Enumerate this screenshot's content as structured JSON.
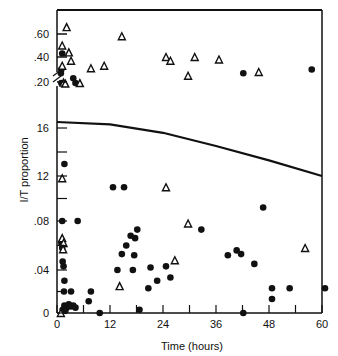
{
  "chart_data": {
    "type": "scatter",
    "title": "",
    "xlabel": "Time (hours)",
    "ylabel": "I/T proportion",
    "xlim": [
      0,
      60
    ],
    "x_ticks": [
      0,
      12,
      24,
      36,
      48,
      60
    ],
    "x_tick_labels": [
      "0",
      "12",
      "24",
      "36",
      "48",
      "60"
    ],
    "axis_break": "y-axis broken between .16 and .20 (upper panel .20–.60)",
    "y_lower": {
      "range": [
        0,
        0.17
      ],
      "ticks": [
        0,
        0.04,
        0.08,
        0.12,
        0.16
      ],
      "tick_labels": [
        "0",
        ".04",
        ".08",
        "12",
        "16"
      ]
    },
    "y_upper": {
      "range": [
        0.17,
        0.7
      ],
      "ticks": [
        0.2,
        0.4,
        0.6
      ],
      "tick_labels": [
        ".20",
        ".40",
        ".60"
      ]
    },
    "grid": false,
    "legend": "none",
    "series": [
      {
        "name": "filled circles",
        "marker": "circle-filled",
        "points": [
          [
            0.5,
            0.43
          ],
          [
            0.3,
            0.3
          ],
          [
            0.2,
            0.27
          ],
          [
            3,
            0.23
          ],
          [
            3.5,
            0.183
          ],
          [
            0.3,
            0.183
          ],
          [
            1,
            0.13
          ],
          [
            12,
            0.11
          ],
          [
            14.5,
            0.11
          ],
          [
            0.5,
            0.08
          ],
          [
            4,
            0.08
          ],
          [
            16,
            0.068
          ],
          [
            17,
            0.066
          ],
          [
            17.5,
            0.073
          ],
          [
            15,
            0.06
          ],
          [
            14,
            0.053
          ],
          [
            16.8,
            0.052
          ],
          [
            0.3,
            0.062
          ],
          [
            0.5,
            0.058
          ],
          [
            0.6,
            0.047
          ],
          [
            0.8,
            0.043
          ],
          [
            1,
            0.03
          ],
          [
            0.9,
            0.02
          ],
          [
            2.5,
            0.02
          ],
          [
            1,
            0.007
          ],
          [
            1.5,
            0.005
          ],
          [
            2,
            0.008
          ],
          [
            2.5,
            0.006
          ],
          [
            3,
            0.007
          ],
          [
            3.5,
            0.005
          ],
          [
            0.6,
            0.003
          ],
          [
            1.2,
            0.002
          ],
          [
            7,
            0.02
          ],
          [
            6.5,
            0.011
          ],
          [
            9,
            0.0
          ],
          [
            20,
            0.023
          ],
          [
            18,
            0.003
          ],
          [
            13,
            0.04
          ],
          [
            16.5,
            0.04
          ],
          [
            20.5,
            0.042
          ],
          [
            22,
            0.03
          ],
          [
            24,
            0.043
          ],
          [
            25,
            0.033
          ],
          [
            32,
            0.073
          ],
          [
            38,
            0.052
          ],
          [
            40,
            0.056
          ],
          [
            41,
            0.053
          ],
          [
            44,
            0.045
          ],
          [
            41.5,
            0.0
          ],
          [
            46,
            0.092
          ],
          [
            48,
            0.023
          ],
          [
            48,
            0.013
          ],
          [
            52,
            0.023
          ],
          [
            60,
            0.023
          ],
          [
            41.5,
            0.27
          ],
          [
            57,
            0.3
          ]
        ]
      },
      {
        "name": "open triangles",
        "marker": "triangle-open",
        "points": [
          [
            1.5,
            0.66
          ],
          [
            0.5,
            0.5
          ],
          [
            2,
            0.44
          ],
          [
            2.5,
            0.37
          ],
          [
            0.5,
            0.33
          ],
          [
            10,
            0.33
          ],
          [
            7,
            0.31
          ],
          [
            14,
            0.58
          ],
          [
            4.5,
            0.183
          ],
          [
            0.8,
            0.19
          ],
          [
            1.2,
            0.175
          ],
          [
            24,
            0.4
          ],
          [
            25,
            0.37
          ],
          [
            30.5,
            0.4
          ],
          [
            29,
            0.25
          ],
          [
            36,
            0.38
          ],
          [
            45,
            0.28
          ],
          [
            0.5,
            0.118
          ],
          [
            24,
            0.11
          ],
          [
            0.5,
            0.066
          ],
          [
            0.8,
            0.062
          ],
          [
            0.7,
            0.057
          ],
          [
            29,
            0.078
          ],
          [
            26,
            0.048
          ],
          [
            13.5,
            0.025
          ],
          [
            55.5,
            0.058
          ],
          [
            0.2,
            0.0
          ]
        ]
      }
    ],
    "curve": {
      "name": "fitted line",
      "points": [
        [
          0,
          0.165
        ],
        [
          12,
          0.163
        ],
        [
          24,
          0.156
        ],
        [
          36,
          0.145
        ],
        [
          48,
          0.133
        ],
        [
          60,
          0.12
        ]
      ]
    }
  }
}
